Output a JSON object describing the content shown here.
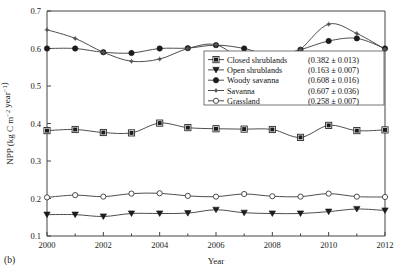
{
  "panel": {
    "label": "(b)"
  },
  "chart_data": {
    "type": "line",
    "title": "",
    "xlabel": "Year",
    "ylabel": "NPP (kg C m⁻² year⁻¹)",
    "ylabel_plain": "NPP (kg C m-2 year-1)",
    "x": [
      2000,
      2001,
      2002,
      2003,
      2004,
      2005,
      2006,
      2007,
      2008,
      2009,
      2010,
      2011,
      2012
    ],
    "xlim": [
      2000,
      2012
    ],
    "ylim": [
      0.1,
      0.7
    ],
    "xticks": [
      2000,
      2002,
      2004,
      2006,
      2008,
      2010,
      2012
    ],
    "xtick_labels": [
      "2000",
      "2002",
      "2004",
      "2006",
      "2008",
      "2010",
      "2012"
    ],
    "xminorticks": [
      2001,
      2003,
      2005,
      2007,
      2009,
      2011
    ],
    "yticks": [
      0.1,
      0.2,
      0.3,
      0.4,
      0.5,
      0.6,
      0.7
    ],
    "ytick_labels": [
      "0.1",
      "0.2",
      "0.3",
      "0.4",
      "0.5",
      "0.6",
      "0.7"
    ],
    "grid": false,
    "legend_position": "center-right",
    "series": [
      {
        "name": "Closed shrublands",
        "stat": "(0.382 ± 0.013)",
        "marker": "square-open",
        "values": [
          0.381,
          0.384,
          0.376,
          0.375,
          0.401,
          0.389,
          0.386,
          0.385,
          0.384,
          0.363,
          0.395,
          0.381,
          0.383
        ]
      },
      {
        "name": "Open shrublands",
        "stat": "(0.163 ± 0.007)",
        "marker": "triangle-down-filled",
        "values": [
          0.157,
          0.157,
          0.152,
          0.16,
          0.16,
          0.161,
          0.17,
          0.162,
          0.16,
          0.16,
          0.165,
          0.172,
          0.168
        ]
      },
      {
        "name": "Woody savanna",
        "stat": "(0.608 ± 0.016)",
        "marker": "circle-filled",
        "values": [
          0.6,
          0.6,
          0.59,
          0.588,
          0.6,
          0.601,
          0.609,
          0.6,
          0.581,
          0.597,
          0.62,
          0.627,
          0.6
        ]
      },
      {
        "name": "Savanna",
        "stat": "(0.607 ± 0.036)",
        "marker": "star-small",
        "values": [
          0.65,
          0.627,
          0.59,
          0.566,
          0.572,
          0.6,
          0.61,
          0.565,
          0.53,
          0.597,
          0.665,
          0.64,
          0.598
        ]
      },
      {
        "name": "Grassland",
        "stat": "(0.258 ± 0.007)",
        "marker": "circle-open",
        "values": [
          0.203,
          0.209,
          0.205,
          0.213,
          0.214,
          0.207,
          0.205,
          0.212,
          0.206,
          0.205,
          0.213,
          0.205,
          0.204
        ]
      }
    ]
  }
}
